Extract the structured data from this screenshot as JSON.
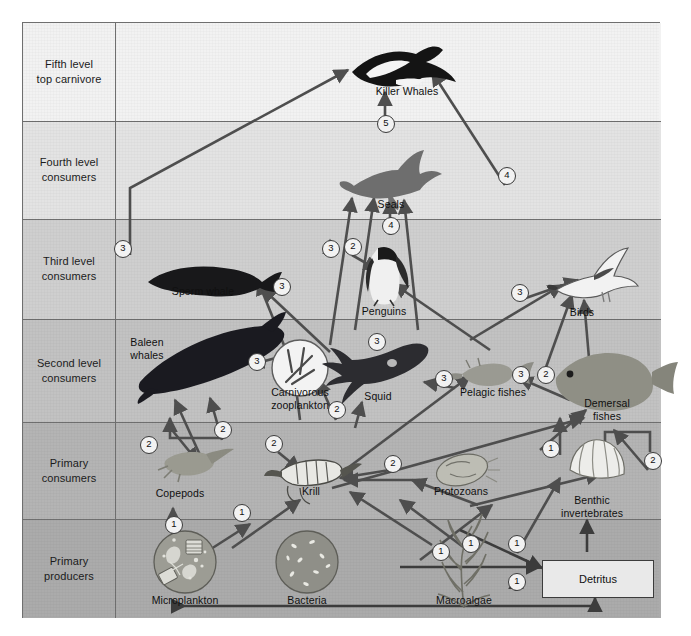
{
  "diagram": {
    "frame_color": "#6f6f6f"
  },
  "levels": [
    {
      "id": "fifth",
      "label": "Fifth level\ntop carnivore",
      "bg": "#f2f2f2",
      "top": 0,
      "height": 98
    },
    {
      "id": "fourth",
      "label": "Fourth level\nconsumers",
      "bg": "#e3e3e3",
      "top": 98,
      "height": 98
    },
    {
      "id": "third",
      "label": "Third level\nconsumers",
      "bg": "#cfcfcf",
      "top": 196,
      "height": 100
    },
    {
      "id": "second",
      "label": "Second level\nconsumers",
      "bg": "#c2c2c2",
      "top": 296,
      "height": 103
    },
    {
      "id": "primary_consumers",
      "label": "Primary\nconsumers",
      "bg": "#b4b4b4",
      "top": 399,
      "height": 97
    },
    {
      "id": "primary_producers",
      "label": "Primary\nproducers",
      "bg": "#ababab",
      "top": 496,
      "height": 99
    }
  ],
  "organisms": [
    {
      "id": "killer-whales",
      "label": "Killer Whales",
      "x": 407,
      "y": 92,
      "level": "fifth"
    },
    {
      "id": "seals",
      "label": "Seals",
      "x": 391,
      "y": 205,
      "level": "fourth"
    },
    {
      "id": "sperm-whale",
      "label": "Sperm whale",
      "x": 203,
      "y": 292,
      "level": "third"
    },
    {
      "id": "penguins",
      "label": "Penguins",
      "x": 384,
      "y": 312,
      "level": "third"
    },
    {
      "id": "birds",
      "label": "Birds",
      "x": 582,
      "y": 313,
      "level": "third"
    },
    {
      "id": "baleen-whales",
      "label": "Baleen\nwhales",
      "x": 147,
      "y": 343,
      "level": "second"
    },
    {
      "id": "carnivorous-zooplankton",
      "label": "Carnivorous\nzooplankton",
      "x": 300,
      "y": 393,
      "level": "second"
    },
    {
      "id": "squid",
      "label": "Squid",
      "x": 378,
      "y": 397,
      "level": "second"
    },
    {
      "id": "pelagic-fishes",
      "label": "Pelagic fishes",
      "x": 493,
      "y": 393,
      "level": "second"
    },
    {
      "id": "demersal-fishes",
      "label": "Demersal\nfishes",
      "x": 607,
      "y": 404,
      "level": "second"
    },
    {
      "id": "copepods",
      "label": "Copepods",
      "x": 180,
      "y": 494,
      "level": "primary_consumers"
    },
    {
      "id": "krill",
      "label": "Krill",
      "x": 311,
      "y": 492,
      "level": "primary_consumers"
    },
    {
      "id": "protozoans",
      "label": "Protozoans",
      "x": 461,
      "y": 492,
      "level": "primary_consumers"
    },
    {
      "id": "benthic-invertebrates",
      "label": "Benthic\ninvertebrates",
      "x": 592,
      "y": 501,
      "level": "primary_consumers"
    },
    {
      "id": "microplankton",
      "label": "Microplankton",
      "x": 185,
      "y": 601,
      "level": "primary_producers"
    },
    {
      "id": "bacteria",
      "label": "Bacteria",
      "x": 307,
      "y": 601,
      "level": "primary_producers"
    },
    {
      "id": "macroalgae",
      "label": "Macroalgae",
      "x": 464,
      "y": 601,
      "level": "primary_producers"
    },
    {
      "id": "detritus",
      "label": "Detritus",
      "x": 597,
      "y": 578,
      "level": "primary_producers"
    }
  ],
  "detritus_box": {
    "label": "Detritus",
    "x": 542,
    "y": 560,
    "w": 110,
    "h": 36
  },
  "markers": [
    {
      "value": "3",
      "x": 122,
      "y": 248
    },
    {
      "value": "5",
      "x": 385,
      "y": 123
    },
    {
      "value": "4",
      "x": 506,
      "y": 175
    },
    {
      "value": "4",
      "x": 390,
      "y": 225
    },
    {
      "value": "3",
      "x": 330,
      "y": 248
    },
    {
      "value": "2",
      "x": 352,
      "y": 246
    },
    {
      "value": "3",
      "x": 281,
      "y": 286
    },
    {
      "value": "3",
      "x": 519,
      "y": 292
    },
    {
      "value": "3",
      "x": 376,
      "y": 341
    },
    {
      "value": "3",
      "x": 256,
      "y": 361
    },
    {
      "value": "3",
      "x": 443,
      "y": 378
    },
    {
      "value": "3",
      "x": 520,
      "y": 374
    },
    {
      "value": "2",
      "x": 545,
      "y": 374
    },
    {
      "value": "2",
      "x": 336,
      "y": 409
    },
    {
      "value": "2",
      "x": 652,
      "y": 460
    },
    {
      "value": "2",
      "x": 148,
      "y": 444
    },
    {
      "value": "2",
      "x": 222,
      "y": 429
    },
    {
      "value": "2",
      "x": 273,
      "y": 443
    },
    {
      "value": "2",
      "x": 392,
      "y": 463
    },
    {
      "value": "1",
      "x": 550,
      "y": 448
    },
    {
      "value": "1",
      "x": 241,
      "y": 512
    },
    {
      "value": "1",
      "x": 173,
      "y": 524
    },
    {
      "value": "1",
      "x": 440,
      "y": 551
    },
    {
      "value": "1",
      "x": 470,
      "y": 543
    },
    {
      "value": "1",
      "x": 516,
      "y": 543
    },
    {
      "value": "1",
      "x": 516,
      "y": 581
    }
  ],
  "legend_numbers": [
    "1",
    "2",
    "3",
    "4",
    "5"
  ]
}
